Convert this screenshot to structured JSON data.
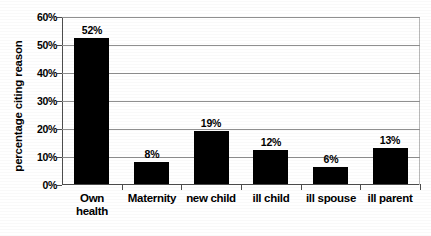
{
  "chart_data": {
    "type": "bar",
    "title": "",
    "subtitle": "",
    "xlabel": "",
    "ylabel": "percentage citing reason",
    "categories": [
      "Own health",
      "Maternity",
      "new child",
      "ill child",
      "ill spouse",
      "ill parent"
    ],
    "category_lines": [
      [
        "Own",
        "health"
      ],
      [
        "Maternity"
      ],
      [
        "new child"
      ],
      [
        "ill child"
      ],
      [
        "ill spouse"
      ],
      [
        "ill parent"
      ]
    ],
    "values": [
      52,
      8,
      19,
      12,
      6,
      13
    ],
    "data_labels": [
      "52%",
      "8%",
      "19%",
      "12%",
      "6%",
      "13%"
    ],
    "ylim": [
      0,
      60
    ],
    "ytick_values": [
      0,
      10,
      20,
      30,
      40,
      50,
      60
    ],
    "ytick_labels": [
      "0%",
      "10%",
      "20%",
      "30%",
      "40%",
      "50%",
      "60%"
    ],
    "grid": true,
    "grid_axis": "y",
    "legend": false,
    "legend_position": "none",
    "bar_color": "#000000",
    "gridline_color": "#8f8f8f",
    "axis_color": "#4d4d4d",
    "background_color": "#ffffff"
  }
}
